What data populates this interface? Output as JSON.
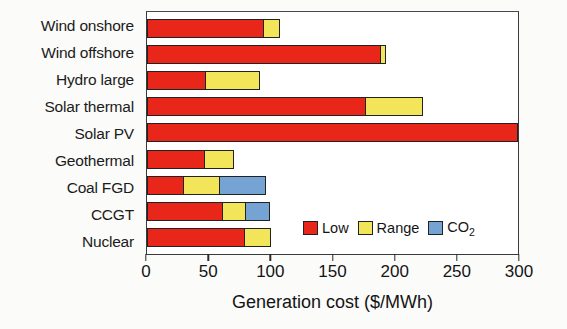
{
  "chart_data": {
    "type": "bar",
    "orientation": "horizontal",
    "stacked": true,
    "title": "",
    "xlabel": "Generation cost ($/MWh)",
    "ylabel": "",
    "xlim": [
      0,
      300
    ],
    "xticks": [
      0,
      50,
      100,
      150,
      200,
      250,
      300
    ],
    "xticklabels": [
      "0",
      "50",
      "100",
      "150",
      "200",
      "250",
      "300"
    ],
    "grid": false,
    "legend_position": "inside-lower-right",
    "categories": [
      "Wind onshore",
      "Wind offshore",
      "Hydro large",
      "Solar thermal",
      "Solar PV",
      "Geothermal",
      "Coal FGD",
      "CCGT",
      "Nuclear"
    ],
    "series": [
      {
        "name": "Low",
        "color": "#e8271a",
        "values": [
          94,
          188,
          48,
          176,
          300,
          47,
          30,
          61,
          79
        ]
      },
      {
        "name": "Range",
        "color": "#f2e55a",
        "values": [
          14,
          5,
          44,
          47,
          0,
          24,
          30,
          20,
          22
        ]
      },
      {
        "name": "CO2",
        "color": "#74a3d4",
        "values": [
          0,
          0,
          0,
          0,
          0,
          0,
          38,
          20,
          0
        ]
      }
    ],
    "totals": [
      108,
      193,
      92,
      223,
      300,
      71,
      98,
      101,
      101
    ]
  },
  "legend": {
    "items": [
      {
        "label": "Low",
        "label_sub": "",
        "color": "#e8271a"
      },
      {
        "label": "Range",
        "label_sub": "",
        "color": "#f2e55a"
      },
      {
        "label": "CO",
        "label_sub": "2",
        "color": "#74a3d4"
      }
    ]
  },
  "axis": {
    "x_title": "Generation cost ($/MWh)"
  }
}
